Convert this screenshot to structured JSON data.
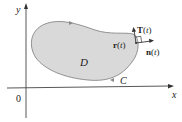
{
  "diagram": {
    "axes": {
      "x_label": "x",
      "y_label": "y",
      "origin_label": "0"
    },
    "region": {
      "label": "D",
      "fill": "#d9d9d9",
      "stroke": "#777777"
    },
    "curve": {
      "label": "C"
    },
    "vectors": {
      "position_label_main": "r",
      "tangent_label_main": "T",
      "normal_label_main": "n",
      "param": "t",
      "position_label": "r(t)",
      "tangent_label": "T(t)",
      "normal_label": "n(t)"
    }
  }
}
